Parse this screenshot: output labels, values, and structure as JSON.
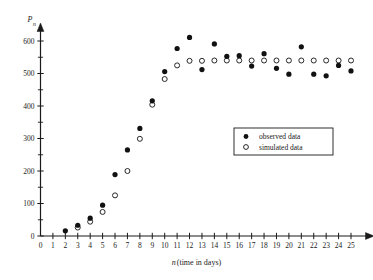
{
  "chart_data": {
    "type": "scatter",
    "title": "",
    "xlabel": "n (time in days)",
    "xlabel_italic_part": "n",
    "xlabel_plain_part": "(time in days)",
    "ylabel": "P_n",
    "ylabel_base": "P",
    "ylabel_sub": "n",
    "xlim": [
      0,
      25
    ],
    "ylim": [
      0,
      620
    ],
    "x_ticks": [
      0,
      1,
      2,
      3,
      4,
      5,
      6,
      7,
      8,
      9,
      10,
      11,
      12,
      13,
      14,
      15,
      16,
      17,
      18,
      19,
      20,
      21,
      22,
      23,
      24,
      25
    ],
    "y_ticks_major": [
      0,
      100,
      200,
      300,
      400,
      500,
      600
    ],
    "y_ticks_minor": [
      50,
      150,
      250,
      350,
      450,
      550
    ],
    "grid": false,
    "legend_position": "center-right",
    "x": [
      2,
      3,
      4,
      5,
      6,
      7,
      8,
      9,
      10,
      11,
      12,
      13,
      14,
      15,
      16,
      17,
      18,
      19,
      20,
      21,
      22,
      23,
      24,
      25
    ],
    "series": [
      {
        "name": "observed data",
        "marker": "filled-circle",
        "color": "#111111",
        "values": [
          16,
          33,
          55,
          95,
          189,
          265,
          331,
          416,
          506,
          577,
          611,
          512,
          591,
          553,
          555,
          523,
          561,
          516,
          498,
          582,
          498,
          493,
          525,
          508
        ]
      },
      {
        "name": "simulated data",
        "marker": "open-circle",
        "color": "#ffffff",
        "values": [
          null,
          26,
          44,
          74,
          125,
          200,
          299,
          404,
          483,
          525,
          539,
          539,
          540,
          540,
          540,
          540,
          540,
          540,
          540,
          540,
          540,
          540,
          540,
          540
        ]
      }
    ],
    "legend": [
      {
        "marker": "filled-circle",
        "label": "observed data"
      },
      {
        "marker": "open-circle",
        "label": "simulated data"
      }
    ]
  },
  "colors": {
    "observed": "#111111",
    "simulated_fill": "#ffffff",
    "axis": "#1a1a1a",
    "background": "#ffffff"
  }
}
